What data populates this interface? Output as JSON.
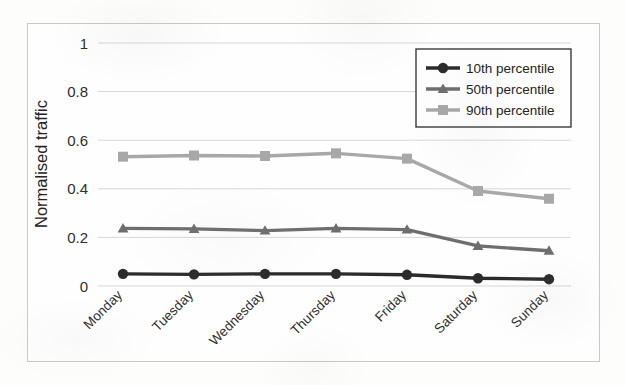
{
  "chart_data": {
    "type": "line",
    "title": "",
    "xlabel": "",
    "ylabel": "Normalised traffic",
    "categories": [
      "Monday",
      "Tuesday",
      "Wednesday",
      "Thursday",
      "Friday",
      "Saturday",
      "Sunday"
    ],
    "series": [
      {
        "name": "10th percentile",
        "marker": "circle",
        "color": "#2b2b2b",
        "values": [
          0.05,
          0.048,
          0.05,
          0.05,
          0.046,
          0.032,
          0.028
        ]
      },
      {
        "name": "50th percentile",
        "marker": "triangle",
        "color": "#6e6e6e",
        "values": [
          0.237,
          0.235,
          0.228,
          0.237,
          0.232,
          0.165,
          0.145
        ]
      },
      {
        "name": "90th percentile",
        "marker": "square",
        "color": "#a8a8a8",
        "values": [
          0.532,
          0.537,
          0.535,
          0.546,
          0.524,
          0.391,
          0.359
        ]
      }
    ],
    "ylim": [
      0,
      1
    ],
    "yticks": [
      "0",
      "0.2",
      "0.4",
      "0.6",
      "0.8",
      "1"
    ],
    "ytick_values": [
      0,
      0.2,
      0.4,
      0.6,
      0.8,
      1
    ],
    "grid": true,
    "legend_position": "top-right"
  },
  "legend": {
    "entries": [
      {
        "label": "10th percentile"
      },
      {
        "label": "50th percentile"
      },
      {
        "label": "90th percentile"
      }
    ]
  },
  "colors": {
    "series_10th": "#2b2b2b",
    "series_50th": "#6e6e6e",
    "series_90th": "#a8a8a8",
    "gridline": "#d7d7d5",
    "border": "#c9c9c7"
  }
}
